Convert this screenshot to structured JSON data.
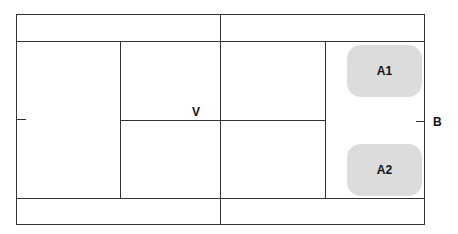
{
  "diagram": {
    "labels": {
      "center": "V",
      "right": "B"
    },
    "blocks": [
      {
        "id": "a1",
        "label": "A1"
      },
      {
        "id": "a2",
        "label": "A2"
      }
    ],
    "colors": {
      "line": "#333333",
      "block_fill": "#dcdcdc",
      "background": "#ffffff"
    }
  }
}
